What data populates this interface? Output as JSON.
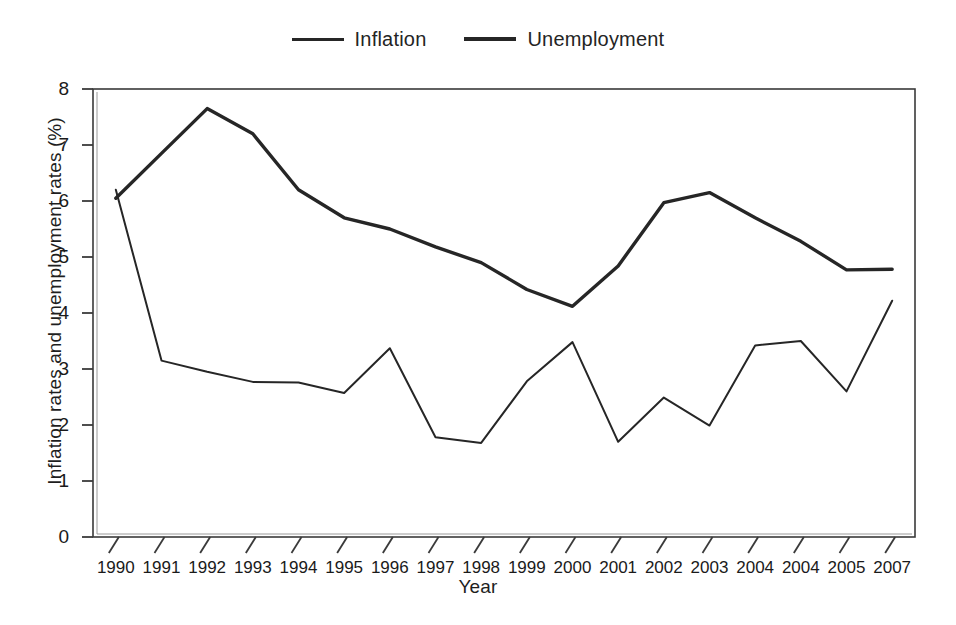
{
  "chart_data": {
    "type": "line",
    "title": "",
    "xlabel": "Year",
    "ylabel": "Inflation rates and unemployment rates (%)",
    "categories": [
      "1990",
      "1991",
      "1992",
      "1993",
      "1994",
      "1995",
      "1996",
      "1997",
      "1998",
      "1999",
      "2000",
      "2001",
      "2002",
      "2003",
      "2004",
      "2004",
      "2005",
      "2007"
    ],
    "ylim": [
      0,
      8
    ],
    "yticks": [
      "0",
      "1",
      "2",
      "3",
      "4",
      "5",
      "6",
      "7",
      "8"
    ],
    "grid": false,
    "legend_position": "top-center",
    "series": [
      {
        "name": "Inflation",
        "style": "thin",
        "values": [
          6.2,
          3.15,
          2.95,
          2.77,
          2.76,
          2.57,
          3.37,
          1.78,
          1.68,
          2.78,
          3.48,
          1.7,
          2.49,
          1.99,
          3.42,
          3.5,
          2.6,
          4.22
        ]
      },
      {
        "name": "Unemployment",
        "style": "thick",
        "values": [
          6.05,
          6.85,
          7.65,
          7.2,
          6.2,
          5.7,
          5.5,
          5.18,
          4.9,
          4.42,
          4.12,
          4.84,
          5.97,
          6.15,
          5.7,
          5.28,
          4.77,
          4.78
        ]
      }
    ]
  },
  "legend": {
    "entries": [
      {
        "label": "Inflation",
        "swatch": "thin-line-swatch"
      },
      {
        "label": "Unemployment",
        "swatch": "thick-line-swatch"
      }
    ]
  },
  "axes": {
    "y_title": "Inflation rates and unemployment rates (%)",
    "x_title": "Year"
  },
  "colors": {
    "line": "#262626",
    "axis": "#3a3a3a",
    "text": "#1a1a1a",
    "background": "#ffffff"
  }
}
